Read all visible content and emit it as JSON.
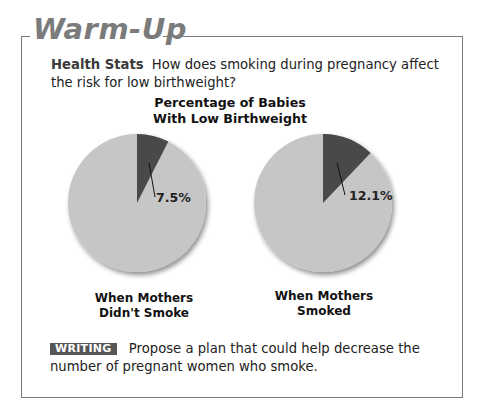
{
  "header": {
    "title": "Warm-Up"
  },
  "question": {
    "lead": "Health Stats",
    "text": "How does smoking during pregnancy affect the risk for low birthweight?"
  },
  "chart_data": {
    "type": "pie",
    "title": "Percentage of Babies With Low Birthweight",
    "title_lines": [
      "Percentage of Babies",
      "With Low Birthweight"
    ],
    "charts": [
      {
        "caption": "When Mothers Didn't Smoke",
        "caption_lines": [
          "When Mothers",
          "Didn't Smoke"
        ],
        "slices": [
          {
            "name": "Low birthweight",
            "value": 7.5,
            "color": "#4a4a4a"
          },
          {
            "name": "Not low birthweight",
            "value": 92.5,
            "color": "#c6c6c6"
          }
        ],
        "label": "7.5%"
      },
      {
        "caption": "When Mothers Smoked",
        "caption_lines": [
          "When Mothers",
          "Smoked"
        ],
        "slices": [
          {
            "name": "Low birthweight",
            "value": 12.1,
            "color": "#4a4a4a"
          },
          {
            "name": "Not low birthweight",
            "value": 87.9,
            "color": "#c6c6c6"
          }
        ],
        "label": "12.1%"
      }
    ]
  },
  "writing": {
    "badge": "WRITING",
    "text": "Propose a plan that could help decrease the number of pregnant women who smoke."
  },
  "colors": {
    "frame": "#7a7a7a",
    "title": "#7b7b7b",
    "badge_bg": "#575757",
    "slice_dark": "#4a4a4a",
    "slice_light": "#c6c6c6"
  }
}
